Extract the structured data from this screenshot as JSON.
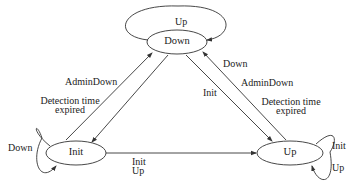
{
  "diagram": {
    "type": "state-machine",
    "states": [
      {
        "id": "down",
        "label": "Down"
      },
      {
        "id": "init",
        "label": "Init"
      },
      {
        "id": "up",
        "label": "Up"
      }
    ],
    "transitions": {
      "down_self": {
        "label": "Up"
      },
      "init_self": {
        "label": "Down"
      },
      "up_self": {
        "line1": "Init",
        "line2": "Up"
      },
      "init_to_down": {
        "line1": "AdminDown",
        "line2": "Detection time",
        "line3": "expired"
      },
      "down_to_up": {
        "label": "Init"
      },
      "up_to_down": {
        "line1": "Down",
        "line2": "AdminDown",
        "line3": "Detection time",
        "line4": "expired"
      },
      "init_to_up": {
        "line1": "Init",
        "line2": "Up"
      }
    }
  }
}
